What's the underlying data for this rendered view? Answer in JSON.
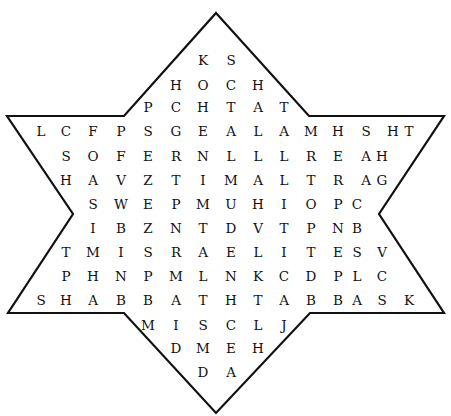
{
  "puzzle": {
    "type": "word-search",
    "shape": "star-of-david",
    "outline_color": "#111111",
    "rows": [
      {
        "y": 60,
        "cells": [
          {
            "x": 203,
            "l": "K"
          },
          {
            "x": 231,
            "l": "S"
          }
        ]
      },
      {
        "y": 85,
        "cells": [
          {
            "x": 176,
            "l": "H"
          },
          {
            "x": 203,
            "l": "O"
          },
          {
            "x": 231,
            "l": "C"
          },
          {
            "x": 258,
            "l": "H"
          }
        ]
      },
      {
        "y": 107,
        "cells": [
          {
            "x": 148,
            "l": "P"
          },
          {
            "x": 176,
            "l": "C"
          },
          {
            "x": 203,
            "l": "H"
          },
          {
            "x": 231,
            "l": "T"
          },
          {
            "x": 258,
            "l": "A"
          },
          {
            "x": 284,
            "l": "T"
          }
        ]
      },
      {
        "y": 131,
        "cells": [
          {
            "x": 41,
            "l": "L"
          },
          {
            "x": 66,
            "l": "C"
          },
          {
            "x": 93,
            "l": "F"
          },
          {
            "x": 121,
            "l": "P"
          },
          {
            "x": 148,
            "l": "S"
          },
          {
            "x": 176,
            "l": "G"
          },
          {
            "x": 203,
            "l": "E"
          },
          {
            "x": 231,
            "l": "A"
          },
          {
            "x": 258,
            "l": "L"
          },
          {
            "x": 284,
            "l": "A"
          },
          {
            "x": 311,
            "l": "M"
          },
          {
            "x": 338,
            "l": "H"
          },
          {
            "x": 366,
            "l": "S"
          },
          {
            "x": 393,
            "l": "H"
          },
          {
            "x": 409,
            "l": "T"
          }
        ]
      },
      {
        "y": 156,
        "cells": [
          {
            "x": 66,
            "l": "S"
          },
          {
            "x": 93,
            "l": "O"
          },
          {
            "x": 121,
            "l": "F"
          },
          {
            "x": 148,
            "l": "E"
          },
          {
            "x": 176,
            "l": "R"
          },
          {
            "x": 203,
            "l": "N"
          },
          {
            "x": 231,
            "l": "L"
          },
          {
            "x": 258,
            "l": "L"
          },
          {
            "x": 284,
            "l": "L"
          },
          {
            "x": 311,
            "l": "R"
          },
          {
            "x": 338,
            "l": "E"
          },
          {
            "x": 366,
            "l": "A"
          },
          {
            "x": 382,
            "l": "H"
          }
        ]
      },
      {
        "y": 180,
        "cells": [
          {
            "x": 66,
            "l": "H"
          },
          {
            "x": 93,
            "l": "A"
          },
          {
            "x": 121,
            "l": "V"
          },
          {
            "x": 148,
            "l": "Z"
          },
          {
            "x": 176,
            "l": "T"
          },
          {
            "x": 203,
            "l": "I"
          },
          {
            "x": 231,
            "l": "M"
          },
          {
            "x": 258,
            "l": "A"
          },
          {
            "x": 284,
            "l": "L"
          },
          {
            "x": 311,
            "l": "T"
          },
          {
            "x": 338,
            "l": "R"
          },
          {
            "x": 366,
            "l": "A"
          },
          {
            "x": 382,
            "l": "G"
          }
        ]
      },
      {
        "y": 204,
        "cells": [
          {
            "x": 93,
            "l": "S"
          },
          {
            "x": 121,
            "l": "W"
          },
          {
            "x": 148,
            "l": "E"
          },
          {
            "x": 176,
            "l": "P"
          },
          {
            "x": 203,
            "l": "M"
          },
          {
            "x": 231,
            "l": "U"
          },
          {
            "x": 258,
            "l": "H"
          },
          {
            "x": 284,
            "l": "I"
          },
          {
            "x": 311,
            "l": "O"
          },
          {
            "x": 338,
            "l": "P"
          },
          {
            "x": 357,
            "l": "C"
          }
        ]
      },
      {
        "y": 228,
        "cells": [
          {
            "x": 93,
            "l": "I"
          },
          {
            "x": 121,
            "l": "B"
          },
          {
            "x": 148,
            "l": "Z"
          },
          {
            "x": 176,
            "l": "N"
          },
          {
            "x": 203,
            "l": "T"
          },
          {
            "x": 231,
            "l": "D"
          },
          {
            "x": 258,
            "l": "V"
          },
          {
            "x": 284,
            "l": "T"
          },
          {
            "x": 311,
            "l": "P"
          },
          {
            "x": 338,
            "l": "N"
          },
          {
            "x": 357,
            "l": "B"
          }
        ]
      },
      {
        "y": 252,
        "cells": [
          {
            "x": 66,
            "l": "T"
          },
          {
            "x": 93,
            "l": "M"
          },
          {
            "x": 121,
            "l": "I"
          },
          {
            "x": 148,
            "l": "S"
          },
          {
            "x": 176,
            "l": "R"
          },
          {
            "x": 203,
            "l": "A"
          },
          {
            "x": 231,
            "l": "E"
          },
          {
            "x": 258,
            "l": "L"
          },
          {
            "x": 284,
            "l": "I"
          },
          {
            "x": 311,
            "l": "T"
          },
          {
            "x": 338,
            "l": "E"
          },
          {
            "x": 357,
            "l": "S"
          },
          {
            "x": 382,
            "l": "V"
          }
        ]
      },
      {
        "y": 276,
        "cells": [
          {
            "x": 66,
            "l": "P"
          },
          {
            "x": 93,
            "l": "H"
          },
          {
            "x": 121,
            "l": "N"
          },
          {
            "x": 148,
            "l": "P"
          },
          {
            "x": 176,
            "l": "M"
          },
          {
            "x": 203,
            "l": "L"
          },
          {
            "x": 231,
            "l": "N"
          },
          {
            "x": 258,
            "l": "K"
          },
          {
            "x": 284,
            "l": "C"
          },
          {
            "x": 311,
            "l": "D"
          },
          {
            "x": 338,
            "l": "P"
          },
          {
            "x": 357,
            "l": "L"
          },
          {
            "x": 382,
            "l": "C"
          }
        ]
      },
      {
        "y": 300,
        "cells": [
          {
            "x": 41,
            "l": "S"
          },
          {
            "x": 66,
            "l": "H"
          },
          {
            "x": 93,
            "l": "A"
          },
          {
            "x": 121,
            "l": "B"
          },
          {
            "x": 148,
            "l": "B"
          },
          {
            "x": 176,
            "l": "A"
          },
          {
            "x": 203,
            "l": "T"
          },
          {
            "x": 231,
            "l": "H"
          },
          {
            "x": 258,
            "l": "T"
          },
          {
            "x": 284,
            "l": "A"
          },
          {
            "x": 311,
            "l": "B"
          },
          {
            "x": 338,
            "l": "B"
          },
          {
            "x": 357,
            "l": "A"
          },
          {
            "x": 382,
            "l": "S"
          },
          {
            "x": 409,
            "l": "K"
          }
        ]
      },
      {
        "y": 325,
        "cells": [
          {
            "x": 148,
            "l": "M"
          },
          {
            "x": 176,
            "l": "I"
          },
          {
            "x": 203,
            "l": "S"
          },
          {
            "x": 231,
            "l": "C"
          },
          {
            "x": 258,
            "l": "L"
          },
          {
            "x": 284,
            "l": "J"
          }
        ]
      },
      {
        "y": 348,
        "cells": [
          {
            "x": 176,
            "l": "D"
          },
          {
            "x": 203,
            "l": "M"
          },
          {
            "x": 231,
            "l": "E"
          },
          {
            "x": 258,
            "l": "H"
          }
        ]
      },
      {
        "y": 372,
        "cells": [
          {
            "x": 203,
            "l": "D"
          },
          {
            "x": 231,
            "l": "A"
          }
        ]
      }
    ]
  }
}
